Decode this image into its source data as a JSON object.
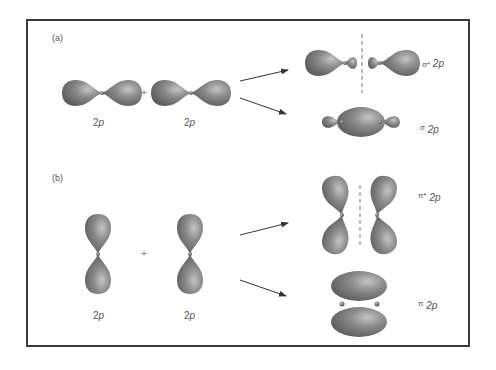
{
  "panels": [
    {
      "id": "a",
      "label": "(a)",
      "left_orbital_label_num": "2",
      "left_orbital_label_sym": "p",
      "right_orbital_label_num": "2",
      "right_orbital_label_sym": "p",
      "operator": "+",
      "results": [
        {
          "name": "sigma-star-2p",
          "symbol": "σ*",
          "subscript": "2p",
          "type": "antibonding"
        },
        {
          "name": "sigma-2p",
          "symbol": "σ",
          "subscript": "2p",
          "type": "bonding"
        }
      ]
    },
    {
      "id": "b",
      "label": "(b)",
      "left_orbital_label_num": "2",
      "left_orbital_label_sym": "p",
      "right_orbital_label_num": "2",
      "right_orbital_label_sym": "p",
      "operator": "+",
      "results": [
        {
          "name": "pi-star-2p",
          "symbol": "π*",
          "subscript": "2p",
          "type": "antibonding"
        },
        {
          "name": "pi-2p",
          "symbol": "π",
          "subscript": "2p",
          "type": "bonding"
        }
      ]
    }
  ],
  "colors": {
    "lobe": "#7a7a7a",
    "lobe_highlight": "#bdbdbd",
    "lobe_shadow": "#5a5a5a",
    "arrow": "#333333",
    "border": "#3a3a3a",
    "node_line": "#777777"
  }
}
